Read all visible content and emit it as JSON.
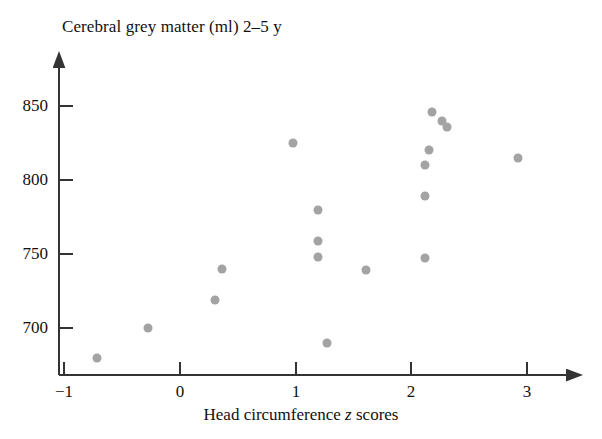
{
  "chart_data": {
    "type": "scatter",
    "title": "Cerebral grey matter (ml) 2–5 y",
    "xlabel_prefix": "Head circumference ",
    "xlabel_italic": "z",
    "xlabel_suffix": " scores",
    "xlabel_full": "Head circumference z scores",
    "ylabel": "Cerebral grey matter (ml) 2–5 y",
    "xlim": [
      -1.15,
      3.3
    ],
    "ylim": [
      672,
      862
    ],
    "xticks": [
      -1,
      0,
      1,
      2,
      3
    ],
    "xtick_labels": [
      "−1",
      "0",
      "1",
      "2",
      "3"
    ],
    "yticks": [
      700,
      750,
      800,
      850
    ],
    "ytick_labels": [
      "700",
      "750",
      "800",
      "850"
    ],
    "grid": false,
    "legend": false,
    "marker_color": "#a3a3a3",
    "axis_color": "#333333",
    "points": [
      {
        "x": -0.72,
        "y": 680
      },
      {
        "x": -0.28,
        "y": 700
      },
      {
        "x": 0.3,
        "y": 719
      },
      {
        "x": 0.36,
        "y": 740
      },
      {
        "x": 0.98,
        "y": 825
      },
      {
        "x": 1.19,
        "y": 780
      },
      {
        "x": 1.19,
        "y": 759
      },
      {
        "x": 1.19,
        "y": 748
      },
      {
        "x": 1.27,
        "y": 690
      },
      {
        "x": 1.61,
        "y": 739
      },
      {
        "x": 2.12,
        "y": 789
      },
      {
        "x": 2.12,
        "y": 747
      },
      {
        "x": 2.12,
        "y": 810
      },
      {
        "x": 2.15,
        "y": 820
      },
      {
        "x": 2.18,
        "y": 846
      },
      {
        "x": 2.26,
        "y": 840
      },
      {
        "x": 2.31,
        "y": 836
      },
      {
        "x": 2.92,
        "y": 815
      }
    ]
  }
}
